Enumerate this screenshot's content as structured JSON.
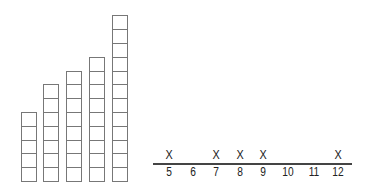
{
  "chart_data": [
    {
      "type": "bar",
      "title": "",
      "description": "Towers of stacked unit cubes",
      "categories": [
        "tower-1",
        "tower-2",
        "tower-3",
        "tower-4",
        "tower-5"
      ],
      "values": [
        5,
        7,
        8,
        9,
        12
      ],
      "xlabel": "",
      "ylabel": "",
      "grid": false
    },
    {
      "type": "scatter",
      "subtype": "line-plot",
      "title": "",
      "x_ticks": [
        "5",
        "6",
        "7",
        "8",
        "9",
        "10",
        "11",
        "12"
      ],
      "marks": [
        {
          "x": 5,
          "count": 1
        },
        {
          "x": 7,
          "count": 1
        },
        {
          "x": 8,
          "count": 1
        },
        {
          "x": 9,
          "count": 1
        },
        {
          "x": 12,
          "count": 1
        }
      ],
      "mark_symbol": "X",
      "xlim": [
        5,
        12
      ],
      "grid": false
    }
  ],
  "towers": [
    {
      "cubes": 5,
      "left": 21
    },
    {
      "cubes": 7,
      "left": 43
    },
    {
      "cubes": 8,
      "left": 66
    },
    {
      "cubes": 9,
      "left": 89
    },
    {
      "cubes": 12,
      "left": 112
    }
  ],
  "line_plot": {
    "ticks": [
      {
        "label": "5",
        "x": 169
      },
      {
        "label": "6",
        "x": 193
      },
      {
        "label": "7",
        "x": 216
      },
      {
        "label": "8",
        "x": 240
      },
      {
        "label": "9",
        "x": 263
      },
      {
        "label": "10",
        "x": 288
      },
      {
        "label": "11",
        "x": 314
      },
      {
        "label": "12",
        "x": 338
      }
    ],
    "marks": [
      {
        "symbol": "X",
        "x": 169
      },
      {
        "symbol": "X",
        "x": 216
      },
      {
        "symbol": "X",
        "x": 240
      },
      {
        "symbol": "X",
        "x": 263
      },
      {
        "symbol": "X",
        "x": 338
      }
    ]
  }
}
